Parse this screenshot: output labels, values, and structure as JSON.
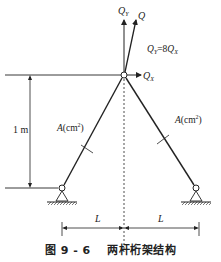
{
  "diagram": {
    "forces": {
      "qy_label": "Q",
      "qy_sub": "Y",
      "q_label": "Q",
      "qx_label": "Q",
      "qx_sub": "X",
      "relation_lhs": "Q",
      "relation_lhs_sub": "Y",
      "relation_eq": "=8",
      "relation_rhs": "Q",
      "relation_rhs_sub": "X"
    },
    "height_label": "1 m",
    "left_bar": {
      "area_var": "A",
      "area_unit": "(cm",
      "area_exp": "2",
      "area_close": ")"
    },
    "right_bar": {
      "area_var": "A",
      "area_unit": "(cm",
      "area_exp": "2",
      "area_close": ")"
    },
    "span_left": "L",
    "span_right": "L",
    "colors": {
      "line": "#222222",
      "background": "#ffffff"
    }
  },
  "caption": {
    "figure_number": "图 9 - 6",
    "title": "两杆桁架结构"
  }
}
